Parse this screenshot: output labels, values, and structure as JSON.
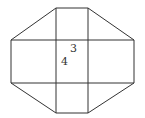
{
  "diagram": {
    "stroke_color": "#333333",
    "background": "#ffffff",
    "labels": [
      {
        "text": "3",
        "x": 70,
        "y": 52
      },
      {
        "text": "4",
        "x": 61,
        "y": 65
      }
    ],
    "outline_points": "56,8 88,8 134,40 134,83 88,113 56,113 11,83 11,40",
    "vertical_lines": [
      {
        "x": 56,
        "y1": 8,
        "y2": 113
      },
      {
        "x": 88,
        "y1": 8,
        "y2": 113
      }
    ],
    "horizontal_lines": [
      {
        "y": 40,
        "x1": 11,
        "x2": 134
      },
      {
        "y": 83,
        "x1": 11,
        "x2": 134
      }
    ]
  }
}
